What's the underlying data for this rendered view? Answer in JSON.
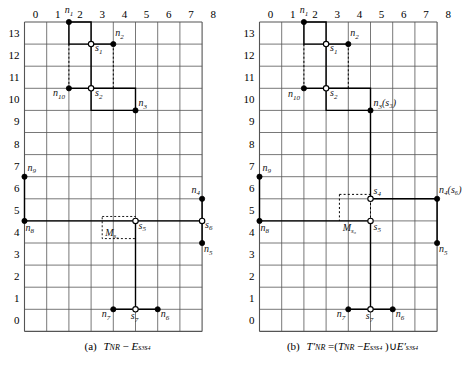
{
  "figure": {
    "x_ticks": [
      "0",
      "1",
      "2",
      "3",
      "4",
      "5",
      "6",
      "7",
      "8"
    ],
    "y_ticks": [
      "13",
      "12",
      "11",
      "10",
      "9",
      "8",
      "7",
      "6",
      "5",
      "4",
      "3",
      "2",
      "1",
      "0"
    ],
    "colors": {
      "grid": "#555555",
      "stroke": "#000000",
      "node_fill": "#000000",
      "switch_fill": "#ffffff"
    }
  },
  "panels": [
    {
      "id": "a",
      "caption_prefix": "(a)",
      "caption_main": "T",
      "caption_sub1": "NR",
      "caption_op": " − E",
      "caption_sub2": "s₃s₄",
      "caption_plain": "(a) T_NR − E_{s3s4}",
      "solid_paths": [
        [
          [
            2,
            13
          ],
          [
            3,
            13
          ],
          [
            3,
            12
          ],
          [
            3,
            10
          ],
          [
            3,
            9
          ],
          [
            5,
            9
          ]
        ],
        [
          [
            3,
            12
          ],
          [
            4,
            12
          ]
        ],
        [
          [
            2,
            10
          ],
          [
            3,
            10
          ]
        ],
        [
          [
            3,
            10
          ],
          [
            5,
            10
          ],
          [
            5,
            9
          ]
        ],
        [
          [
            0,
            6
          ],
          [
            0,
            4
          ]
        ],
        [
          [
            0,
            4
          ],
          [
            8,
            4
          ]
        ],
        [
          [
            8,
            5
          ],
          [
            8,
            3
          ]
        ],
        [
          [
            5,
            4
          ],
          [
            5,
            0
          ]
        ],
        [
          [
            4,
            0
          ],
          [
            6,
            0
          ]
        ],
        [
          [
            2,
            13
          ],
          [
            2,
            12
          ],
          [
            3,
            12
          ]
        ]
      ],
      "dashed_paths": [
        [
          [
            2,
            12
          ],
          [
            2,
            10
          ]
        ],
        [
          [
            4,
            12
          ],
          [
            4,
            10
          ]
        ]
      ],
      "dotted_rects": [
        {
          "x": 3.5,
          "y": 3.2,
          "w": 1.5,
          "h": 1.0,
          "label": "M",
          "sub": "s₆"
        }
      ],
      "nodes": [
        {
          "id": "n1",
          "x": 2,
          "y": 13,
          "type": "node",
          "label": "n",
          "sub": "1",
          "lx": 0,
          "ly": -9,
          "anchor": "middle"
        },
        {
          "id": "n2",
          "x": 4,
          "y": 12,
          "type": "node",
          "label": "n",
          "sub": "2",
          "lx": 2,
          "ly": -8,
          "anchor": "start"
        },
        {
          "id": "s1",
          "x": 3,
          "y": 12,
          "type": "switch",
          "label": "s",
          "sub": "1",
          "lx": 4,
          "ly": 7,
          "anchor": "start"
        },
        {
          "id": "n10",
          "x": 2,
          "y": 10,
          "type": "node",
          "label": "n",
          "sub": "10",
          "lx": -4,
          "ly": 8,
          "anchor": "end"
        },
        {
          "id": "s2",
          "x": 3,
          "y": 10,
          "type": "switch",
          "label": "s",
          "sub": "2",
          "lx": 4,
          "ly": 8,
          "anchor": "start"
        },
        {
          "id": "n3",
          "x": 5,
          "y": 9,
          "type": "node",
          "label": "n",
          "sub": "3",
          "lx": 3,
          "ly": -4,
          "anchor": "start"
        },
        {
          "id": "n9",
          "x": 0,
          "y": 6,
          "type": "node",
          "label": "n",
          "sub": "9",
          "lx": 3,
          "ly": -6,
          "anchor": "start"
        },
        {
          "id": "n8",
          "x": 0,
          "y": 4,
          "type": "node",
          "label": "n",
          "sub": "8",
          "lx": 1,
          "ly": 10,
          "anchor": "start"
        },
        {
          "id": "n4",
          "x": 8,
          "y": 5,
          "type": "node",
          "label": "n",
          "sub": "4",
          "lx": -2,
          "ly": -6,
          "anchor": "end"
        },
        {
          "id": "s6",
          "x": 8,
          "y": 4,
          "type": "switch",
          "label": "s",
          "sub": "6",
          "lx": 3,
          "ly": 7,
          "anchor": "start"
        },
        {
          "id": "n5",
          "x": 8,
          "y": 3,
          "type": "node",
          "label": "n",
          "sub": "5",
          "lx": 2,
          "ly": 9,
          "anchor": "start"
        },
        {
          "id": "s5",
          "x": 5,
          "y": 4,
          "type": "switch",
          "label": "s",
          "sub": "5",
          "lx": 3,
          "ly": 8,
          "anchor": "start"
        },
        {
          "id": "n7",
          "x": 4,
          "y": 0,
          "type": "node",
          "label": "n",
          "sub": "7",
          "lx": -3,
          "ly": 8,
          "anchor": "end"
        },
        {
          "id": "s7",
          "x": 5,
          "y": 0,
          "type": "switch",
          "label": "s",
          "sub": "7",
          "lx": -1,
          "ly": 10,
          "anchor": "middle"
        },
        {
          "id": "n6",
          "x": 6,
          "y": 0,
          "type": "node",
          "label": "n",
          "sub": "6",
          "lx": 3,
          "ly": 8,
          "anchor": "start"
        }
      ]
    },
    {
      "id": "b",
      "caption_prefix": "(b)",
      "caption_plain": "(b) T'_NR = (T_NR − E_{s3s4}) ∪ E'_{s3s4}",
      "solid_paths": [
        [
          [
            2,
            13
          ],
          [
            3,
            13
          ],
          [
            3,
            12
          ],
          [
            3,
            10
          ],
          [
            3,
            9
          ],
          [
            5,
            9
          ]
        ],
        [
          [
            3,
            12
          ],
          [
            4,
            12
          ]
        ],
        [
          [
            2,
            10
          ],
          [
            3,
            10
          ]
        ],
        [
          [
            3,
            10
          ],
          [
            5,
            10
          ],
          [
            5,
            9
          ]
        ],
        [
          [
            5,
            9
          ],
          [
            5,
            5
          ]
        ],
        [
          [
            5,
            5
          ],
          [
            8,
            5
          ]
        ],
        [
          [
            8,
            5
          ],
          [
            8,
            3
          ]
        ],
        [
          [
            0,
            6
          ],
          [
            0,
            4
          ]
        ],
        [
          [
            0,
            4
          ],
          [
            5,
            4
          ]
        ],
        [
          [
            5,
            4
          ],
          [
            5,
            0
          ]
        ],
        [
          [
            4,
            0
          ],
          [
            6,
            0
          ]
        ],
        [
          [
            2,
            13
          ],
          [
            2,
            12
          ],
          [
            3,
            12
          ]
        ]
      ],
      "dashed_paths": [
        [
          [
            2,
            12
          ],
          [
            2,
            10
          ]
        ],
        [
          [
            4,
            12
          ],
          [
            4,
            10
          ]
        ],
        [
          [
            5,
            5
          ],
          [
            5,
            4
          ]
        ],
        [
          [
            3.6,
            5.2
          ],
          [
            5,
            5.2
          ]
        ],
        [
          [
            3.6,
            5.2
          ],
          [
            3.6,
            4
          ]
        ]
      ],
      "dotted_rects": [],
      "nodes": [
        {
          "id": "n1",
          "x": 2,
          "y": 13,
          "type": "node",
          "label": "n",
          "sub": "1",
          "lx": 0,
          "ly": -9,
          "anchor": "middle"
        },
        {
          "id": "n2",
          "x": 4,
          "y": 12,
          "type": "node",
          "label": "n",
          "sub": "2",
          "lx": 2,
          "ly": -8,
          "anchor": "start"
        },
        {
          "id": "s1",
          "x": 3,
          "y": 12,
          "type": "switch",
          "label": "s",
          "sub": "1",
          "lx": 4,
          "ly": 7,
          "anchor": "start"
        },
        {
          "id": "n10",
          "x": 2,
          "y": 10,
          "type": "node",
          "label": "n",
          "sub": "10",
          "lx": -4,
          "ly": 9,
          "anchor": "end"
        },
        {
          "id": "s2",
          "x": 3,
          "y": 10,
          "type": "switch",
          "label": "s",
          "sub": "2",
          "lx": 4,
          "ly": 8,
          "anchor": "start"
        },
        {
          "id": "n3s3",
          "x": 5,
          "y": 9,
          "type": "node",
          "label": "n",
          "sub": "3",
          "paren": "(s₃)",
          "lx": 3,
          "ly": -4,
          "anchor": "start"
        },
        {
          "id": "n9",
          "x": 0,
          "y": 6,
          "type": "node",
          "label": "n",
          "sub": "9",
          "lx": 3,
          "ly": -6,
          "anchor": "start"
        },
        {
          "id": "n8",
          "x": 0,
          "y": 4,
          "type": "node",
          "label": "n",
          "sub": "8",
          "lx": 1,
          "ly": 10,
          "anchor": "start"
        },
        {
          "id": "s4",
          "x": 5,
          "y": 5,
          "type": "switch",
          "label": "s",
          "sub": "4",
          "lx": 3,
          "ly": -5,
          "anchor": "start"
        },
        {
          "id": "n4s6",
          "x": 8,
          "y": 5,
          "type": "node",
          "label": "n",
          "sub": "4",
          "paren": "(s₆)",
          "lx": 2,
          "ly": -6,
          "anchor": "start"
        },
        {
          "id": "n5",
          "x": 8,
          "y": 3,
          "type": "node",
          "label": "n",
          "sub": "5",
          "lx": 2,
          "ly": 9,
          "anchor": "start"
        },
        {
          "id": "s5",
          "x": 5,
          "y": 4,
          "type": "switch",
          "label": "s",
          "sub": "5",
          "lx": 3,
          "ly": 9,
          "anchor": "start"
        },
        {
          "id": "n7",
          "x": 4,
          "y": 0,
          "type": "node",
          "label": "n",
          "sub": "7",
          "lx": -3,
          "ly": 8,
          "anchor": "end"
        },
        {
          "id": "s7",
          "x": 5,
          "y": 0,
          "type": "switch",
          "label": "s",
          "sub": "7",
          "lx": -1,
          "ly": 10,
          "anchor": "middle"
        },
        {
          "id": "n6",
          "x": 6,
          "y": 0,
          "type": "node",
          "label": "n",
          "sub": "6",
          "lx": 3,
          "ly": 8,
          "anchor": "start"
        }
      ],
      "mlabel": {
        "x": 3.75,
        "y": 4.0,
        "label": "M",
        "sub": "s₆"
      }
    }
  ]
}
